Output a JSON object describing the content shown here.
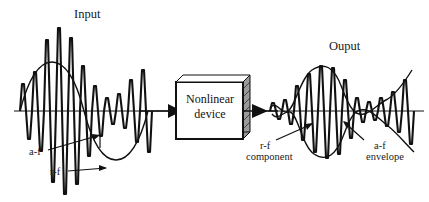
{
  "figure": {
    "type": "block-diagram-with-waveforms",
    "background_color": "#ffffff",
    "stroke_color": "#111111",
    "baseline_y": 111
  },
  "labels": {
    "input": "Input",
    "output": "Ouput",
    "input_af": "a-f",
    "input_rf": "r-f",
    "output_rf_line1": "r-f",
    "output_rf_line2": "component",
    "output_af_line1": "a-f",
    "output_af_line2": "envelope"
  },
  "device_block": {
    "line1": "Nonlinear",
    "line2": "device",
    "shadow_style": "hatched-3d"
  },
  "signals": {
    "input": {
      "description": "Amplitude-modulated input: r-f carrier modulated by a-f sine envelope",
      "carrier_label": "r-f",
      "envelope_label": "a-f"
    },
    "output": {
      "description": "Rectified / distorted output: r-f component with recovered a-f envelope",
      "carrier_label": "r-f component",
      "envelope_label": "a-f envelope"
    }
  },
  "arrows": [
    {
      "name": "input-to-device",
      "direction": "right"
    },
    {
      "name": "device-to-output",
      "direction": "right"
    }
  ]
}
